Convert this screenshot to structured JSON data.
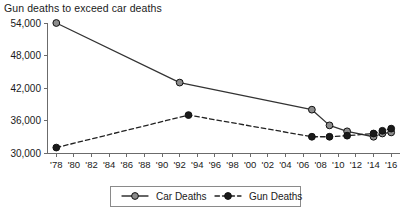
{
  "chart_data": {
    "type": "line",
    "title": "Gun deaths to exceed car deaths",
    "xlabel": "",
    "ylabel": "",
    "ylim": [
      30000,
      54000
    ],
    "yticks": [
      30000,
      36000,
      42000,
      48000,
      54000
    ],
    "ytick_labels": [
      "30,000",
      "36,000",
      "42,000",
      "48,000",
      "54,000"
    ],
    "xlim": [
      1977,
      2017
    ],
    "xticks": [
      1978,
      1980,
      1982,
      1984,
      1986,
      1988,
      1990,
      1992,
      1994,
      1996,
      1998,
      2000,
      2002,
      2004,
      2006,
      2008,
      2010,
      2012,
      2014,
      2016
    ],
    "xtick_labels": [
      "'78",
      "'80",
      "'82",
      "'84",
      "'86",
      "'88",
      "'90",
      "'92",
      "'94",
      "'96",
      "'98",
      "'00",
      "'02",
      "'04",
      "'06",
      "'08",
      "'10",
      "'12",
      "'14",
      "'16"
    ],
    "grid": false,
    "legend_position": "bottom-center",
    "series": [
      {
        "name": "Car Deaths",
        "style": "solid",
        "color": "#333333",
        "marker": "circle",
        "marker_fill": "#8c8c8c",
        "x": [
          1978,
          1992,
          2007,
          2009,
          2011,
          2014,
          2015,
          2016
        ],
        "values": [
          54000,
          43000,
          38000,
          35100,
          34000,
          33000,
          33600,
          33800
        ]
      },
      {
        "name": "Gun Deaths",
        "style": "dashed",
        "color": "#222222",
        "marker": "circle",
        "marker_fill": "#1a1a1a",
        "x": [
          1978,
          1993,
          2007,
          2009,
          2011,
          2014,
          2015,
          2016
        ],
        "values": [
          31000,
          37000,
          33000,
          33000,
          33200,
          33600,
          34100,
          34500
        ]
      }
    ]
  },
  "legend": {
    "items": [
      {
        "label": "Car Deaths"
      },
      {
        "label": "Gun Deaths"
      }
    ]
  }
}
